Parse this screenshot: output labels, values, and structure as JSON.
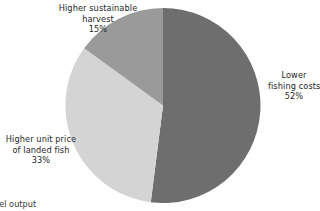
{
  "chart_data": {
    "type": "pie",
    "title": "",
    "categories": [
      "Lower fishing costs",
      "Higher unit price of landed fish",
      "Higher sustainable harvest"
    ],
    "values": [
      52,
      33,
      15
    ],
    "value_suffix": "%",
    "colors": [
      "#6e6e6e",
      "#d4d4d4",
      "#9a9a9a"
    ],
    "legend": "none",
    "labels_position": "outside",
    "start_angle_deg": 0,
    "direction": "clockwise",
    "background": "#ffffff",
    "text_color": "#262626"
  },
  "slices": [
    {
      "name": "lower-fishing-costs",
      "label_lines": [
        "Lower",
        "fishing costs"
      ],
      "percent_label": "52%",
      "value": 52,
      "color": "#6e6e6e"
    },
    {
      "name": "higher-unit-price",
      "label_lines": [
        "Higher unit price",
        "of landed fish"
      ],
      "percent_label": "33%",
      "value": 33,
      "color": "#d4d4d4"
    },
    {
      "name": "higher-sustainable-harvest",
      "label_lines": [
        "Higher sustainable",
        "harvest"
      ],
      "percent_label": "15%",
      "value": 15,
      "color": "#9a9a9a"
    }
  ],
  "caption": {
    "text": "odel output"
  }
}
